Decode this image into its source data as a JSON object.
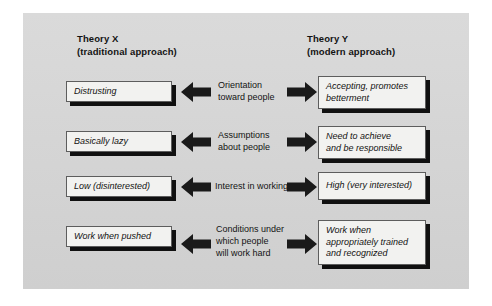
{
  "figure": {
    "panel_color": "#d6d6d6",
    "box_fill": "#f2f2f0",
    "shadow_color": "#101010",
    "arrow_color": "#1a1a1a"
  },
  "columns": {
    "left_heading": "Theory X\n(traditional approach)",
    "right_heading": "Theory Y\n(modern approach)"
  },
  "rows": [
    {
      "left": "Distrusting",
      "center": "Orientation\ntoward people",
      "right": "Accepting, promotes\nbetterment",
      "left_arrow": "left-arrow",
      "right_arrow": "right-arrow"
    },
    {
      "left": "Basically lazy",
      "center": "Assumptions\nabout people",
      "right": "Need to achieve\nand be responsible",
      "left_arrow": "left-arrow",
      "right_arrow": "right-arrow"
    },
    {
      "left": "Low (disinterested)",
      "center": "Interest in working",
      "right": "High (very interested)",
      "left_arrow": "left-arrow",
      "right_arrow": "right-arrow"
    },
    {
      "left": "Work when pushed",
      "center": "Conditions under\nwhich people\nwill work hard",
      "right": "Work when\nappropriately trained\nand recognized",
      "left_arrow": "left-arrow",
      "right_arrow": "right-arrow"
    }
  ]
}
